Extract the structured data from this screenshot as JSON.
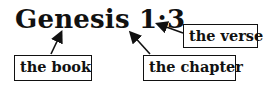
{
  "title": "Genesis 1:3",
  "labels": {
    "book": "the book",
    "chapter": "the chapter",
    "verse": "the verse"
  }
}
